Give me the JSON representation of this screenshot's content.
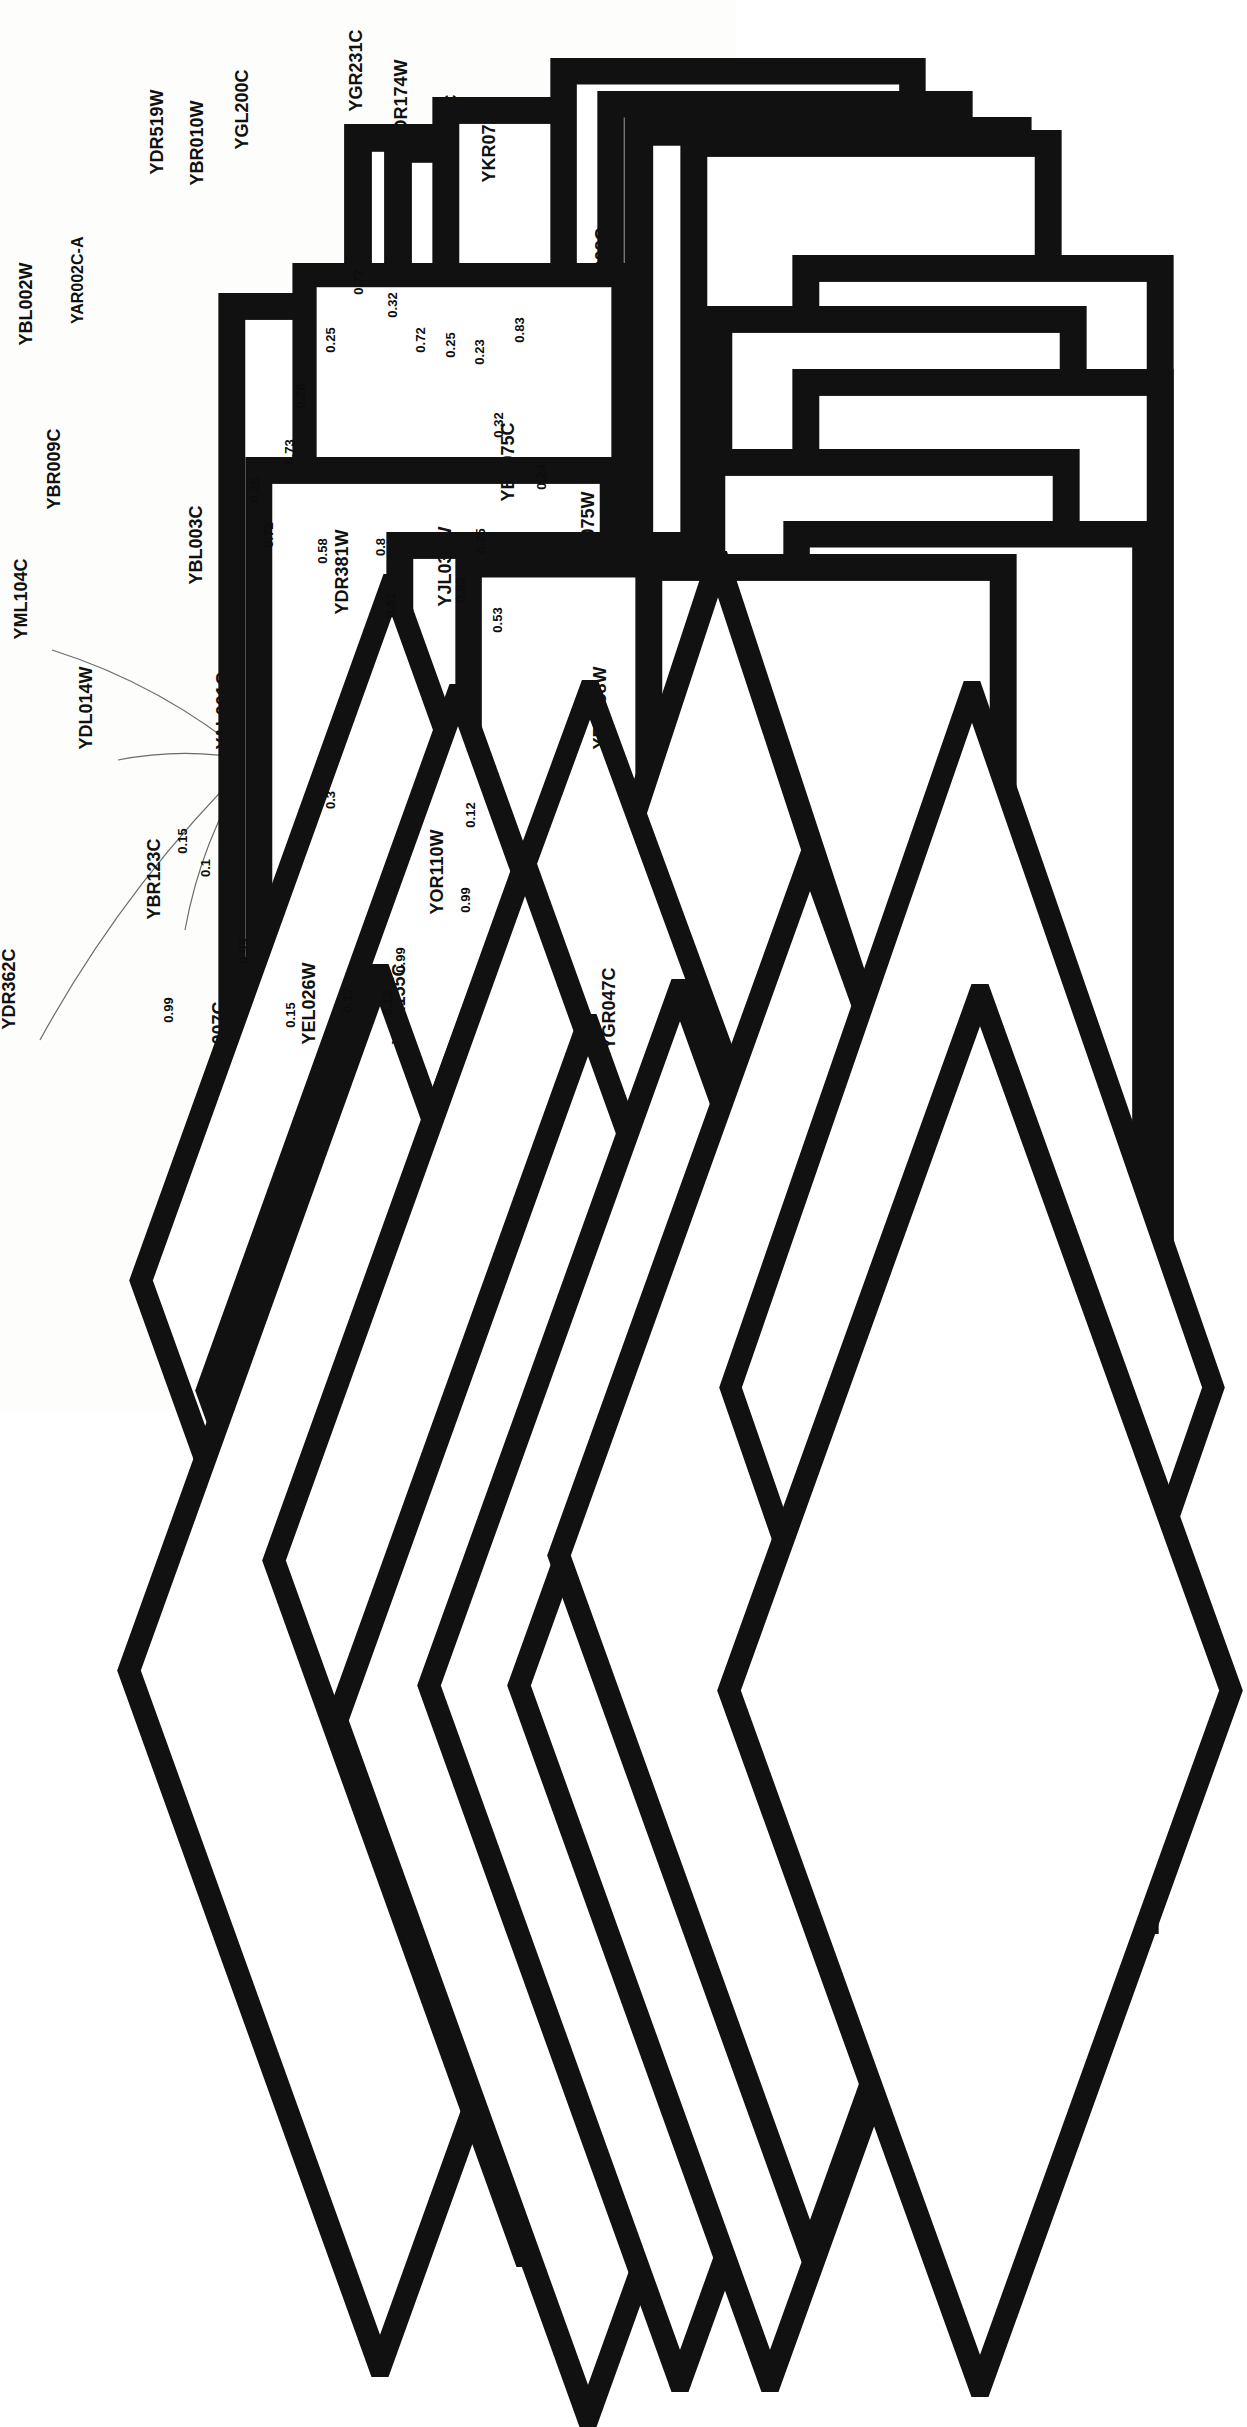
{
  "figure": {
    "type": "network-graph",
    "orientation": "rotated-90-ccw",
    "background": "#fdfdfb",
    "node_shapes": {
      "rectangle": "box",
      "diamond": "diamond"
    },
    "edge_color": "#6b6b6b",
    "node_border_color": "#111111"
  },
  "hubs": [
    {
      "id": "YAL007C",
      "shape": "rectangle"
    },
    {
      "id": "YAL001C",
      "shape": "diamond"
    }
  ],
  "nodes": [
    {
      "id": "YDR519W",
      "shape": "rectangle",
      "x": 190,
      "y": 185,
      "w": 34,
      "h": 122
    },
    {
      "id": "YBR010W",
      "shape": "rectangle",
      "x": 230,
      "y": 196,
      "w": 34,
      "h": 122
    },
    {
      "id": "YGL200C",
      "shape": "rectangle",
      "x": 272,
      "y": 160,
      "w": 34,
      "h": 126
    },
    {
      "id": "YGR231C",
      "shape": "rectangle",
      "x": 387,
      "y": 122,
      "w": 34,
      "h": 128
    },
    {
      "id": "YDR174W",
      "shape": "rectangle",
      "x": 434,
      "y": 155,
      "w": 34,
      "h": 128
    },
    {
      "id": "YIL035C",
      "shape": "rectangle",
      "x": 477,
      "y": 176,
      "w": 34,
      "h": 118
    },
    {
      "id": "YKR072C",
      "shape": "rectangle",
      "x": 520,
      "y": 193,
      "w": 34,
      "h": 126
    },
    {
      "id": "YGL008C",
      "shape": "rectangle",
      "x": 632,
      "y": 318,
      "w": 34,
      "h": 126
    },
    {
      "id": "YDR086C",
      "shape": "rectangle",
      "x": 545,
      "y": 369,
      "w": 34,
      "h": 126
    },
    {
      "id": "YGL049C",
      "shape": "rectangle",
      "x": 632,
      "y": 432,
      "w": 34,
      "h": 126
    },
    {
      "id": "YBL002W",
      "shape": "rectangle",
      "x": 58,
      "y": 356,
      "w": 34,
      "h": 126
    },
    {
      "id": "YAR002C-A",
      "shape": "rectangle",
      "x": 113,
      "y": 333,
      "w": 34,
      "h": 140
    },
    {
      "id": "YBR009C",
      "shape": "rectangle",
      "x": 85,
      "y": 520,
      "w": 34,
      "h": 126
    },
    {
      "id": "YBL003C",
      "shape": "rectangle",
      "x": 226,
      "y": 595,
      "w": 34,
      "h": 126
    },
    {
      "id": "YGL055W",
      "shape": "rectangle",
      "x": 292,
      "y": 615,
      "w": 34,
      "h": 128
    },
    {
      "id": "YBL075C",
      "shape": "rectangle",
      "x": 538,
      "y": 512,
      "w": 34,
      "h": 126
    },
    {
      "id": "YLR075W",
      "shape": "rectangle",
      "x": 620,
      "y": 585,
      "w": 34,
      "h": 128
    },
    {
      "id": "YJL034W",
      "shape": "rectangle",
      "x": 475,
      "y": 617,
      "w": 34,
      "h": 126
    },
    {
      "id": "YDR381W",
      "shape": "diamond",
      "x": 375,
      "y": 625,
      "w": 50,
      "h": 148
    },
    {
      "id": "YML104C",
      "shape": "diamond",
      "x": 52,
      "y": 650,
      "w": 56,
      "h": 152
    },
    {
      "id": "YDL014W",
      "shape": "diamond",
      "x": 118,
      "y": 760,
      "w": 56,
      "h": 152
    },
    {
      "id": "YAL001C",
      "shape": "diamond",
      "x": 252,
      "y": 760,
      "w": 60,
      "h": 160
    },
    {
      "id": "YDR362C",
      "shape": "diamond",
      "x": 40,
      "y": 1040,
      "w": 56,
      "h": 152
    },
    {
      "id": "YBR123C",
      "shape": "diamond",
      "x": 185,
      "y": 930,
      "w": 56,
      "h": 152
    },
    {
      "id": "YPL007C",
      "shape": "diamond",
      "x": 248,
      "y": 1090,
      "w": 56,
      "h": 152
    },
    {
      "id": "YEL026W",
      "shape": "diamond",
      "x": 340,
      "y": 1055,
      "w": 56,
      "h": 152
    },
    {
      "id": "YDR155C",
      "shape": "diamond",
      "x": 430,
      "y": 1055,
      "w": 56,
      "h": 152
    },
    {
      "id": "YOR110W",
      "shape": "diamond",
      "x": 470,
      "y": 925,
      "w": 56,
      "h": 152
    },
    {
      "id": "YBL058W",
      "shape": "diamond",
      "x": 632,
      "y": 760,
      "w": 56,
      "h": 158
    },
    {
      "id": "YGR047C",
      "shape": "diamond",
      "x": 640,
      "y": 1060,
      "w": 56,
      "h": 152
    }
  ],
  "edges": [
    {
      "source": "YAL007C",
      "target": "YDR519W",
      "weight": "0.26"
    },
    {
      "source": "YAL007C",
      "target": "YBR010W",
      "weight": "0.25"
    },
    {
      "source": "YAL007C",
      "target": "YGL200C",
      "weight": "0.77"
    },
    {
      "source": "YAL007C",
      "target": "YGR231C",
      "weight": "0.32"
    },
    {
      "source": "YAL007C",
      "target": "YDR174W",
      "weight": "0.72"
    },
    {
      "source": "YAL007C",
      "target": "YIL035C",
      "weight": "0.25"
    },
    {
      "source": "YAL007C",
      "target": "YKR072C",
      "weight": "0.23"
    },
    {
      "source": "YAL007C",
      "target": "YGL008C",
      "weight": "0.83"
    },
    {
      "source": "YAL007C",
      "target": "YDR086C",
      "weight": "0.32"
    },
    {
      "source": "YAL007C",
      "target": "YGL049C",
      "weight": "0.24"
    },
    {
      "source": "YAL007C",
      "target": "YBL002W",
      "weight": "0.25"
    },
    {
      "source": "YAL007C",
      "target": "YAR002C-A",
      "weight": "0.73"
    },
    {
      "source": "YAL007C",
      "target": "YBR009C",
      "weight": "0.72"
    },
    {
      "source": "YAL007C",
      "target": "YBL003C",
      "weight": "0.58"
    },
    {
      "source": "YAL007C",
      "target": "YGL055W",
      "weight": "0.8"
    },
    {
      "source": "YAL007C",
      "target": "YDR381W",
      "weight": "0.51"
    },
    {
      "source": "YAL007C",
      "target": "YBL075C",
      "weight": "0.25"
    },
    {
      "source": "YAL007C",
      "target": "YJL034W",
      "weight": "0.83"
    },
    {
      "source": "YAL007C",
      "target": "YLR075W",
      "weight": "0.53"
    },
    {
      "source": "YAL001C",
      "target": "YDR381W",
      "weight": "0.3"
    },
    {
      "source": "YAL001C",
      "target": "YML104C",
      "weight": "0.15"
    },
    {
      "source": "YAL001C",
      "target": "YDL014W",
      "weight": "0.1"
    },
    {
      "source": "YAL001C",
      "target": "YDR362C",
      "weight": "0.99"
    },
    {
      "source": "YAL001C",
      "target": "YBR123C",
      "weight": "0.99"
    },
    {
      "source": "YAL001C",
      "target": "YPL007C",
      "weight": "0.15"
    },
    {
      "source": "YAL001C",
      "target": "YEL026W",
      "weight": "0.17"
    },
    {
      "source": "YAL001C",
      "target": "YDR155C",
      "weight": "0.12"
    },
    {
      "source": "YAL001C",
      "target": "YOR110W",
      "weight": "0.99"
    },
    {
      "source": "YAL001C",
      "target": "YBL058W",
      "weight": "0.12"
    },
    {
      "source": "YAL001C",
      "target": "YGR047C",
      "weight": "0.99"
    }
  ],
  "edge_labels": [
    {
      "text": "0.77",
      "x": 358,
      "y": 282
    },
    {
      "text": "0.32",
      "x": 392,
      "y": 305
    },
    {
      "text": "0.25",
      "x": 330,
      "y": 340
    },
    {
      "text": "0.26",
      "x": 300,
      "y": 396
    },
    {
      "text": "0.72",
      "x": 420,
      "y": 340
    },
    {
      "text": "0.25",
      "x": 450,
      "y": 345
    },
    {
      "text": "0.23",
      "x": 479,
      "y": 352
    },
    {
      "text": "0.83",
      "x": 519,
      "y": 330
    },
    {
      "text": "0.73",
      "x": 289,
      "y": 452
    },
    {
      "text": "0.25",
      "x": 254,
      "y": 490
    },
    {
      "text": "0.32",
      "x": 498,
      "y": 425
    },
    {
      "text": "0.24",
      "x": 541,
      "y": 477
    },
    {
      "text": "0.72",
      "x": 268,
      "y": 535
    },
    {
      "text": "0.58",
      "x": 322,
      "y": 551
    },
    {
      "text": "0.8",
      "x": 380,
      "y": 547
    },
    {
      "text": "0.51",
      "x": 390,
      "y": 605
    },
    {
      "text": "0.25",
      "x": 480,
      "y": 541
    },
    {
      "text": "0.83",
      "x": 460,
      "y": 590
    },
    {
      "text": "0.53",
      "x": 497,
      "y": 620
    },
    {
      "text": "0.3",
      "x": 330,
      "y": 800
    },
    {
      "text": "0.15",
      "x": 182,
      "y": 841
    },
    {
      "text": "0.1",
      "x": 205,
      "y": 868
    },
    {
      "text": "0.99",
      "x": 168,
      "y": 1010
    },
    {
      "text": "0.99",
      "x": 243,
      "y": 951
    },
    {
      "text": "0.15",
      "x": 290,
      "y": 1015
    },
    {
      "text": "0.17",
      "x": 347,
      "y": 1000
    },
    {
      "text": "0.12",
      "x": 387,
      "y": 1003
    },
    {
      "text": "0.99",
      "x": 400,
      "y": 960
    },
    {
      "text": "0.12",
      "x": 470,
      "y": 815
    },
    {
      "text": "0.99",
      "x": 465,
      "y": 900
    }
  ]
}
